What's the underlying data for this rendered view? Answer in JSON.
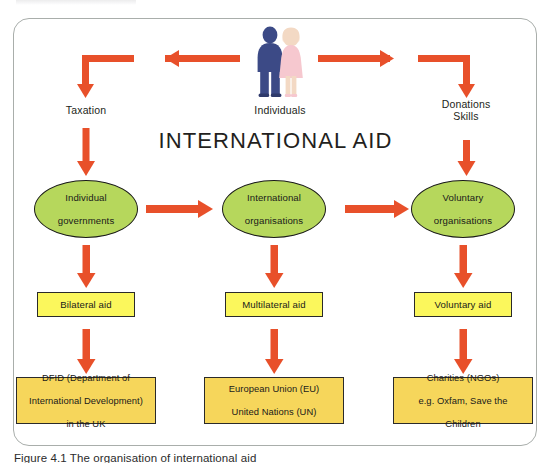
{
  "figure": {
    "title": "INTERNATIONAL AID",
    "caption": "Figure 4.1 The organisation of international aid",
    "frame_border_color": "#a9aeab"
  },
  "palette": {
    "arrow": "#e8502a",
    "ellipse_fill": "#b6d75c",
    "ybox_fill": "#fbf75c",
    "gbox_fill": "#f6d65b",
    "node_outline": "#1a1a1a",
    "male_figure": "#3c4a86",
    "female_figure": "#f6c8cf",
    "female_hair": "#f3d9c4"
  },
  "source": {
    "label": "Individuals",
    "icon": "two-people-icon"
  },
  "flow_labels": {
    "left": "Taxation",
    "right_line1": "Donations",
    "right_line2": "Skills"
  },
  "columns": [
    {
      "key": "left",
      "channel_label": "Taxation",
      "organisation": "Individual\ngovernments",
      "organisation_line1": "Individual",
      "organisation_line2": "governments",
      "aid_type": "Bilateral aid",
      "examples_line1": "DFID (Department of",
      "examples_line2": "International Development)",
      "examples_line3": "in the UK"
    },
    {
      "key": "middle",
      "channel_label": "",
      "organisation_line1": "International",
      "organisation_line2": "organisations",
      "aid_type": "Multilateral aid",
      "examples_line1": "European Union (EU)",
      "examples_line2": "United Nations (UN)",
      "examples_line3": ""
    },
    {
      "key": "right",
      "channel_label": "Donations / Skills",
      "organisation_line1": "Voluntary",
      "organisation_line2": "organisations",
      "aid_type": "Voluntary aid",
      "examples_line1": "Charities (NGOs)",
      "examples_line2": "e.g. Oxfam, Save the",
      "examples_line3": "Children"
    }
  ],
  "arrows": {
    "individuals_to_left": "arrow-left-from-individuals",
    "individuals_to_right": "arrow-right-from-individuals",
    "left_down_to_governments": "arrow-down-taxation",
    "right_down_to_voluntary": "arrow-down-donations",
    "governments_to_international": "arrow-right-governments-to-international",
    "international_to_voluntary": "arrow-right-international-to-voluntary",
    "governments_to_bilateral": "arrow-down-governments-to-bilateral",
    "international_to_multilateral": "arrow-down-international-to-multilateral",
    "voluntary_to_voluntaryaid": "arrow-down-voluntary-to-voluntaryaid",
    "bilateral_to_dfid": "arrow-down-bilateral-to-dfid",
    "multilateral_to_eu": "arrow-down-multilateral-to-eu",
    "voluntaryaid_to_charities": "arrow-down-voluntaryaid-to-charities"
  }
}
